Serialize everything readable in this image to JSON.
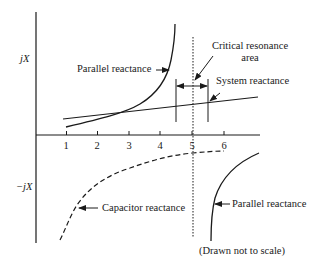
{
  "diagram": {
    "axes": {
      "y_positive_label": "jX",
      "y_negative_label": "−jX",
      "x_ticks": [
        "1",
        "2",
        "3",
        "4",
        "5",
        "6"
      ]
    },
    "labels": {
      "parallel_reactance_upper": "Parallel reactance",
      "critical_resonance_line1": "Critical resonance",
      "critical_resonance_line2": "area",
      "system_reactance": "System reactance",
      "capacitor_reactance": "Capacitor reactance",
      "parallel_reactance_lower": "Parallel reactance",
      "note": "(Drawn not to scale)"
    },
    "colors": {
      "stroke": "#1a1a1a",
      "background": "#ffffff"
    }
  }
}
